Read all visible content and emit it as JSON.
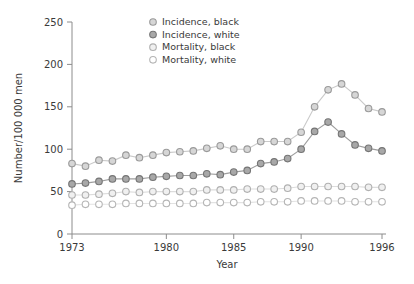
{
  "chart_data": {
    "type": "line",
    "title": "",
    "xlabel": "Year",
    "ylabel": "Number/100 000 men",
    "xlim": [
      1973,
      1996
    ],
    "ylim": [
      0,
      250
    ],
    "xticks": [
      1973,
      1980,
      1985,
      1990,
      1996
    ],
    "yticks": [
      0,
      50,
      100,
      150,
      200,
      250
    ],
    "grid": false,
    "legend_position": "top-center",
    "x": [
      1973,
      1974,
      1975,
      1976,
      1977,
      1978,
      1979,
      1980,
      1981,
      1982,
      1983,
      1984,
      1985,
      1986,
      1987,
      1988,
      1989,
      1990,
      1991,
      1992,
      1993,
      1994,
      1995,
      1996
    ],
    "series": [
      {
        "name": "Incidence, black",
        "marker": "circle",
        "fill": "#d6d6d6",
        "stroke": "#9a9a9a",
        "line": "#c9c9c9",
        "values": [
          83,
          80,
          87,
          86,
          93,
          90,
          93,
          96,
          97,
          98,
          101,
          104,
          100,
          100,
          109,
          109,
          109,
          120,
          150,
          170,
          177,
          164,
          148,
          144
        ]
      },
      {
        "name": "Incidence, white",
        "marker": "circle",
        "fill": "#a8a8a8",
        "stroke": "#757575",
        "line": "#9e9e9e",
        "values": [
          59,
          60,
          62,
          65,
          65,
          65,
          67,
          68,
          69,
          69,
          71,
          70,
          73,
          75,
          83,
          85,
          89,
          100,
          121,
          132,
          118,
          105,
          101,
          98
        ]
      },
      {
        "name": "Mortality, black",
        "marker": "circle",
        "fill": "#f0f0f0",
        "stroke": "#b0b0b0",
        "line": "#dcdcdc",
        "values": [
          46,
          46,
          47,
          48,
          50,
          49,
          50,
          50,
          50,
          50,
          52,
          52,
          52,
          53,
          53,
          53,
          54,
          56,
          56,
          56,
          56,
          56,
          55,
          55
        ]
      },
      {
        "name": "Mortality, white",
        "marker": "circle",
        "fill": "#ffffff",
        "stroke": "#b5b5b5",
        "line": "#e2e2e2",
        "values": [
          34,
          35,
          35,
          35,
          36,
          36,
          36,
          36,
          36,
          36,
          37,
          37,
          37,
          37,
          38,
          38,
          38,
          39,
          39,
          39,
          39,
          38,
          38,
          38
        ]
      }
    ]
  },
  "axes": {
    "y_title": "Number/100 000 men",
    "x_title": "Year",
    "y_tick_labels": [
      "250",
      "200",
      "150",
      "100",
      "50",
      "0"
    ],
    "x_tick_labels": [
      "1973",
      "1980",
      "1985",
      "1990",
      "1996"
    ]
  },
  "legend": {
    "items": [
      {
        "label": "Incidence, black"
      },
      {
        "label": "Incidence, white"
      },
      {
        "label": "Mortality, black"
      },
      {
        "label": "Mortality, white"
      }
    ]
  }
}
